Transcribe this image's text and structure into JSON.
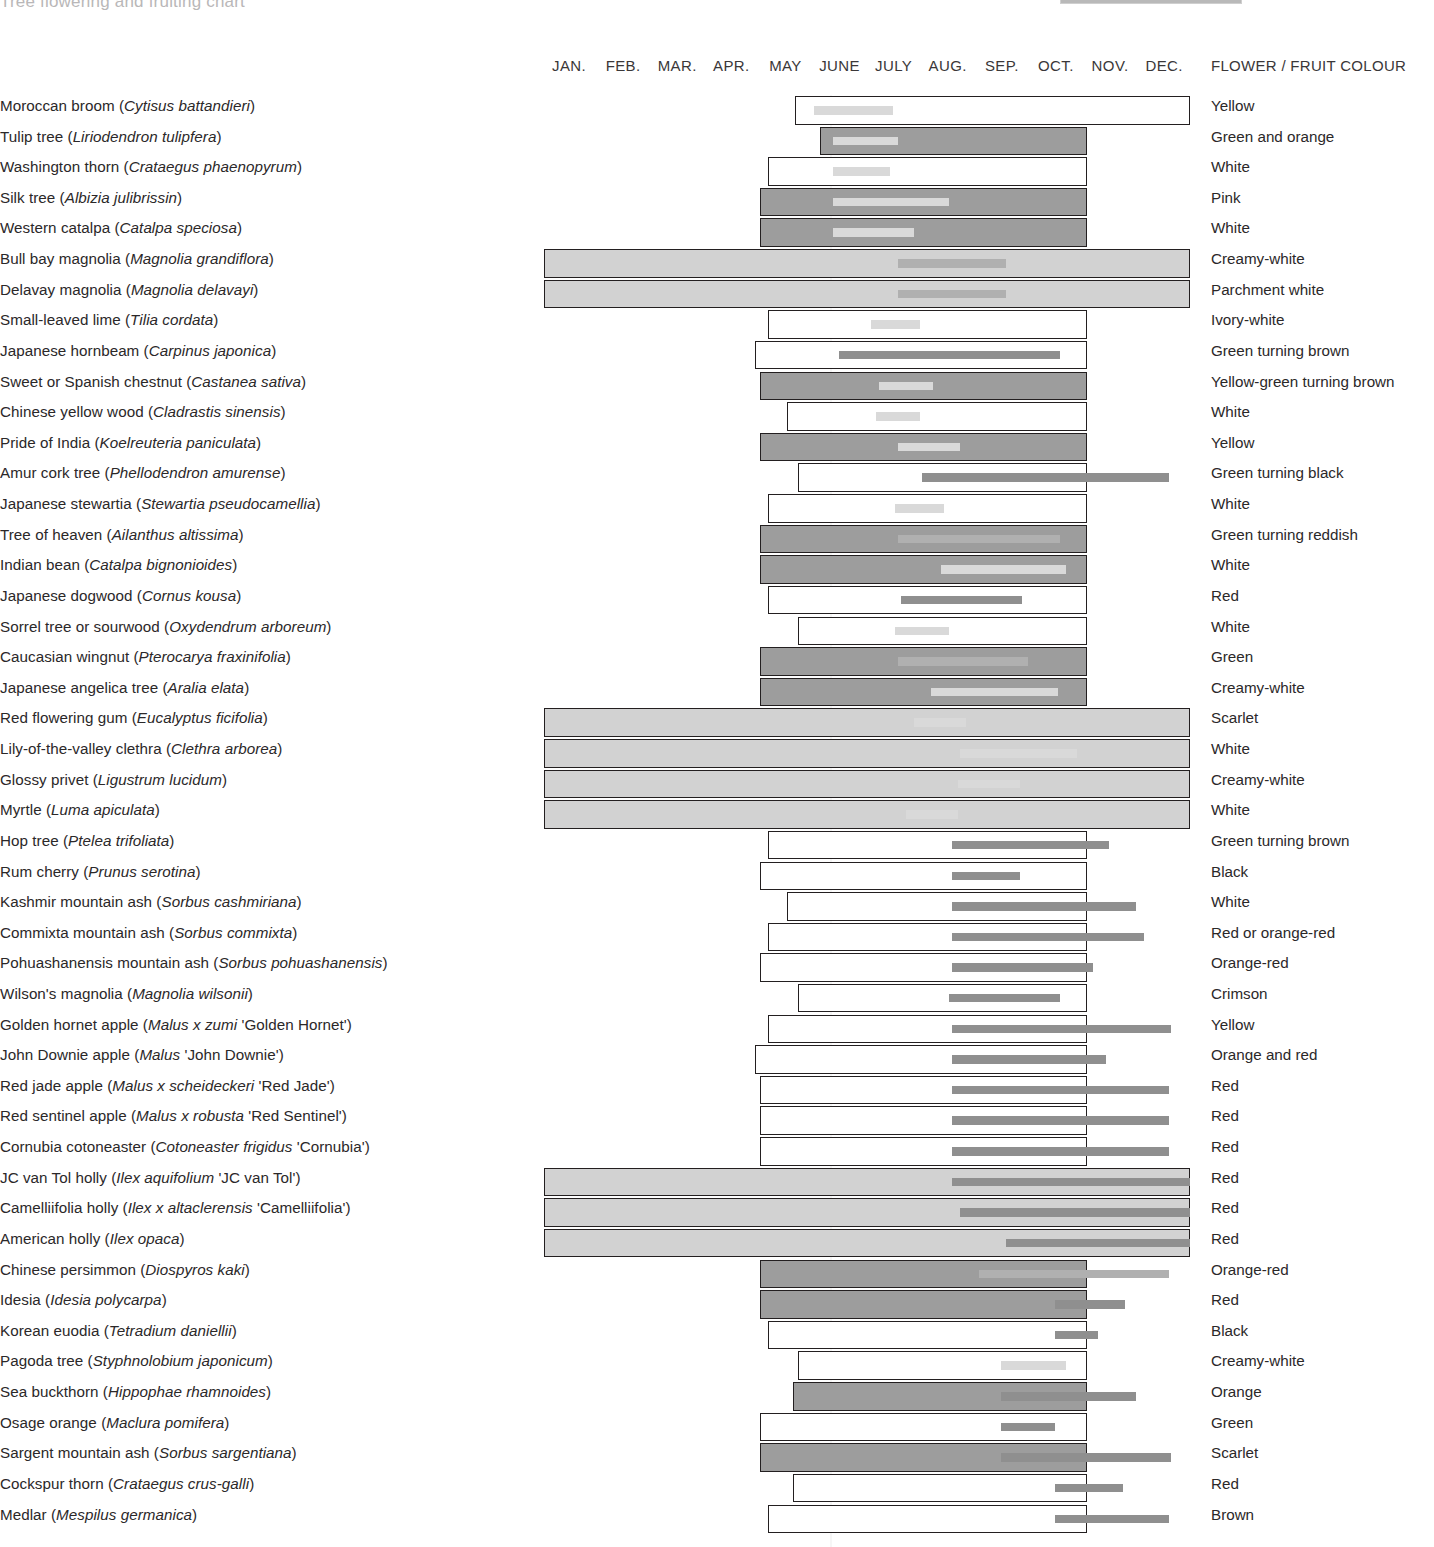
{
  "header": {
    "cropped_title": "Tree flowering and fruiting chart",
    "legend_label": "FLOWERING TIME",
    "legend_swatch_name": "flowering-time-swatch",
    "months": [
      "JAN.",
      "FEB.",
      "MAR.",
      "APR.",
      "MAY",
      "JUNE",
      "JULY",
      "AUG.",
      "SEP.",
      "OCT.",
      "NOV.",
      "DEC."
    ],
    "colour_column_header": "FLOWER / FRUIT COLOUR"
  },
  "palette": {
    "ink": "#231f20",
    "fill_white": "#ffffff",
    "fill_light": "#d2d2d2",
    "fill_mid": "#b3b3b3",
    "fill_dark": "#9d9d9d",
    "bar_pale": "#d9d9d9",
    "bar_mid": "#b0b0b0",
    "bar_dark": "#8f8f8f"
  },
  "chart_data": {
    "type": "bar",
    "xlabel": "Month",
    "ylabel": "Tree species",
    "xlim": [
      0,
      12
    ],
    "x_tick_labels": [
      "JAN.",
      "FEB.",
      "MAR.",
      "APR.",
      "MAY",
      "JUNE",
      "JULY",
      "AUG.",
      "SEP.",
      "OCT.",
      "NOV.",
      "DEC."
    ],
    "grid": false,
    "legend": [
      "FLOWERING TIME"
    ],
    "rows": [
      {
        "common": "Moroccan broom",
        "latin": "Cytisus battandieri",
        "outer": [
          4.7,
          12.0
        ],
        "outer_fill": "white",
        "inner": [
          5.05,
          6.5
        ],
        "inner_tone": "pale",
        "colour": "Yellow"
      },
      {
        "common": "Tulip tree",
        "latin": "Liriodendron tulipfera",
        "outer": [
          5.15,
          10.1
        ],
        "outer_fill": "dark",
        "inner": [
          5.4,
          6.6
        ],
        "inner_tone": "pale",
        "colour": "Green and orange"
      },
      {
        "common": "Washington thorn",
        "latin": "Crataegus phaenopyrum",
        "outer": [
          4.2,
          10.1
        ],
        "outer_fill": "white",
        "inner": [
          5.4,
          6.45
        ],
        "inner_tone": "pale",
        "colour": "White"
      },
      {
        "common": "Silk tree",
        "latin": "Albizia julibrissin",
        "outer": [
          4.05,
          10.1
        ],
        "outer_fill": "dark",
        "inner": [
          5.4,
          7.55
        ],
        "inner_tone": "pale",
        "colour": "Pink"
      },
      {
        "common": "Western catalpa",
        "latin": "Catalpa speciosa",
        "outer": [
          4.05,
          10.1
        ],
        "outer_fill": "dark",
        "inner": [
          5.4,
          6.9
        ],
        "inner_tone": "pale",
        "colour": "White"
      },
      {
        "common": "Bull bay magnolia",
        "latin": "Magnolia grandiflora",
        "outer": [
          0.05,
          12.0
        ],
        "outer_fill": "light",
        "inner": [
          6.6,
          8.6
        ],
        "inner_tone": "mid",
        "colour": "Creamy-white"
      },
      {
        "common": "Delavay magnolia",
        "latin": "Magnolia delavayi",
        "outer": [
          0.05,
          12.0
        ],
        "outer_fill": "light",
        "inner": [
          6.6,
          8.6
        ],
        "inner_tone": "mid",
        "colour": "Parchment white"
      },
      {
        "common": "Small-leaved lime",
        "latin": "Tilia cordata",
        "outer": [
          4.2,
          10.1
        ],
        "outer_fill": "white",
        "inner": [
          6.1,
          7.0
        ],
        "inner_tone": "pale",
        "colour": "Ivory-white"
      },
      {
        "common": "Japanese hornbeam",
        "latin": "Carpinus japonica",
        "outer": [
          3.95,
          10.1
        ],
        "outer_fill": "white",
        "inner": [
          5.5,
          9.6
        ],
        "inner_tone": "dark",
        "colour": "Green turning brown"
      },
      {
        "common": "Sweet or Spanish chestnut",
        "latin": "Castanea sativa",
        "outer": [
          4.05,
          10.1
        ],
        "outer_fill": "dark",
        "inner": [
          6.25,
          7.25
        ],
        "inner_tone": "pale",
        "colour": "Yellow-green turning brown"
      },
      {
        "common": "Chinese yellow wood",
        "latin": "Cladrastis sinensis",
        "outer": [
          4.55,
          10.1
        ],
        "outer_fill": "white",
        "inner": [
          6.2,
          7.0
        ],
        "inner_tone": "pale",
        "colour": "White"
      },
      {
        "common": "Pride of India",
        "latin": "Koelreuteria paniculata",
        "outer": [
          4.05,
          10.1
        ],
        "outer_fill": "dark",
        "inner": [
          6.6,
          7.75
        ],
        "inner_tone": "pale",
        "colour": "Yellow"
      },
      {
        "common": "Amur cork tree",
        "latin": "Phellodendron amurense",
        "outer": [
          4.75,
          10.1
        ],
        "outer_fill": "white",
        "inner": [
          7.05,
          11.6
        ],
        "inner_tone": "dark",
        "colour": "Green turning black"
      },
      {
        "common": "Japanese stewartia",
        "latin": "Stewartia pseudocamellia",
        "outer": [
          4.2,
          10.1
        ],
        "outer_fill": "white",
        "inner": [
          6.55,
          7.45
        ],
        "inner_tone": "pale",
        "colour": "White"
      },
      {
        "common": "Tree of heaven",
        "latin": "Ailanthus altissima",
        "outer": [
          4.05,
          10.1
        ],
        "outer_fill": "dark",
        "inner": [
          6.6,
          9.6
        ],
        "inner_tone": "mid",
        "colour": "Green turning reddish"
      },
      {
        "common": "Indian bean",
        "latin": "Catalpa bignonioides",
        "outer": [
          4.05,
          10.1
        ],
        "outer_fill": "dark",
        "inner": [
          7.4,
          9.7
        ],
        "inner_tone": "pale",
        "colour": "White"
      },
      {
        "common": "Japanese dogwood",
        "latin": "Cornus kousa",
        "outer": [
          4.2,
          10.1
        ],
        "outer_fill": "white",
        "inner": [
          6.65,
          8.9
        ],
        "inner_tone": "dark",
        "colour": "Red"
      },
      {
        "common": "Sorrel tree or sourwood",
        "latin": "Oxydendrum arboreum",
        "outer": [
          4.75,
          10.1
        ],
        "outer_fill": "white",
        "inner": [
          6.55,
          7.55
        ],
        "inner_tone": "pale",
        "colour": "White"
      },
      {
        "common": "Caucasian wingnut",
        "latin": "Pterocarya fraxinifolia",
        "outer": [
          4.05,
          10.1
        ],
        "outer_fill": "dark",
        "inner": [
          6.6,
          9.0
        ],
        "inner_tone": "mid",
        "colour": "Green"
      },
      {
        "common": "Japanese angelica tree",
        "latin": "Aralia elata",
        "outer": [
          4.05,
          10.1
        ],
        "outer_fill": "dark",
        "inner": [
          7.2,
          9.55
        ],
        "inner_tone": "pale",
        "colour": "Creamy-white"
      },
      {
        "common": "Red flowering gum",
        "latin": "Eucalyptus ficifolia",
        "outer": [
          0.05,
          12.0
        ],
        "outer_fill": "light",
        "inner": [
          6.9,
          7.85
        ],
        "inner_tone": "pale",
        "colour": "Scarlet"
      },
      {
        "common": "Lily-of-the-valley clethra",
        "latin": "Clethra arborea",
        "outer": [
          0.05,
          12.0
        ],
        "outer_fill": "light",
        "inner": [
          7.75,
          9.9
        ],
        "inner_tone": "pale",
        "colour": "White"
      },
      {
        "common": "Glossy privet",
        "latin": "Ligustrum lucidum",
        "outer": [
          0.05,
          12.0
        ],
        "outer_fill": "light",
        "inner": [
          7.7,
          8.85
        ],
        "inner_tone": "pale",
        "colour": "Creamy-white"
      },
      {
        "common": "Myrtle",
        "latin": "Luma apiculata",
        "outer": [
          0.05,
          12.0
        ],
        "outer_fill": "light",
        "inner": [
          6.75,
          7.7
        ],
        "inner_tone": "pale",
        "colour": "White"
      },
      {
        "common": "Hop tree",
        "latin": "Ptelea trifoliata",
        "outer": [
          4.2,
          10.1
        ],
        "outer_fill": "white",
        "inner": [
          7.6,
          10.5
        ],
        "inner_tone": "dark",
        "colour": "Green turning brown"
      },
      {
        "common": "Rum cherry",
        "latin": "Prunus serotina",
        "outer": [
          4.05,
          10.1
        ],
        "outer_fill": "white",
        "inner": [
          7.6,
          8.85
        ],
        "inner_tone": "dark",
        "colour": "Black"
      },
      {
        "common": "Kashmir mountain ash",
        "latin": "Sorbus cashmiriana",
        "outer": [
          4.55,
          10.1
        ],
        "outer_fill": "white",
        "inner": [
          7.6,
          11.0
        ],
        "inner_tone": "dark",
        "colour": "White"
      },
      {
        "common": "Commixta mountain ash",
        "latin": "Sorbus commixta",
        "outer": [
          4.2,
          10.1
        ],
        "outer_fill": "white",
        "inner": [
          7.6,
          11.15
        ],
        "inner_tone": "dark",
        "colour": "Red or orange-red"
      },
      {
        "common": "Pohuashanensis mountain ash",
        "latin": "Sorbus pohuashanensis",
        "outer": [
          4.05,
          10.1
        ],
        "outer_fill": "white",
        "inner": [
          7.6,
          10.2
        ],
        "inner_tone": "dark",
        "colour": "Orange-red"
      },
      {
        "common": "Wilson's magnolia",
        "latin": "Magnolia wilsonii",
        "outer": [
          4.75,
          10.1
        ],
        "outer_fill": "white",
        "inner": [
          7.55,
          9.6
        ],
        "inner_tone": "dark",
        "colour": "Crimson"
      },
      {
        "common": "Golden hornet apple",
        "latin": "Malus x zumi 'Golden Hornet'",
        "outer": [
          4.2,
          10.1
        ],
        "outer_fill": "white",
        "inner": [
          7.6,
          11.65
        ],
        "inner_tone": "dark",
        "colour": "Yellow"
      },
      {
        "common": "John Downie apple",
        "latin": "Malus 'John Downie'",
        "outer": [
          3.95,
          10.1
        ],
        "outer_fill": "white",
        "inner": [
          7.6,
          10.45
        ],
        "inner_tone": "dark",
        "colour": "Orange and red"
      },
      {
        "common": "Red jade apple",
        "latin": "Malus x scheideckeri 'Red Jade'",
        "outer": [
          4.05,
          10.1
        ],
        "outer_fill": "white",
        "inner": [
          7.6,
          11.6
        ],
        "inner_tone": "dark",
        "colour": "Red"
      },
      {
        "common": "Red sentinel apple",
        "latin": "Malus x robusta 'Red Sentinel'",
        "outer": [
          4.05,
          10.1
        ],
        "outer_fill": "white",
        "inner": [
          7.6,
          11.6
        ],
        "inner_tone": "dark",
        "colour": "Red"
      },
      {
        "common": "Cornubia cotoneaster",
        "latin": "Cotoneaster frigidus 'Cornubia'",
        "outer": [
          4.05,
          10.1
        ],
        "outer_fill": "white",
        "inner": [
          7.6,
          11.6
        ],
        "inner_tone": "dark",
        "colour": "Red"
      },
      {
        "common": "JC van Tol holly",
        "latin": "Ilex aquifolium 'JC van Tol'",
        "outer": [
          0.05,
          12.0
        ],
        "outer_fill": "light",
        "inner": [
          7.6,
          12.0
        ],
        "inner_tone": "dark",
        "colour": "Red"
      },
      {
        "common": "Camelliifolia holly",
        "latin": "Ilex x altaclerensis 'Camelliifolia'",
        "outer": [
          0.05,
          12.0
        ],
        "outer_fill": "light",
        "inner": [
          7.75,
          12.0
        ],
        "inner_tone": "dark",
        "colour": "Red"
      },
      {
        "common": "American holly",
        "latin": "Ilex opaca",
        "outer": [
          0.05,
          12.0
        ],
        "outer_fill": "light",
        "inner": [
          8.6,
          12.0
        ],
        "inner_tone": "dark",
        "colour": "Red"
      },
      {
        "common": "Chinese persimmon",
        "latin": "Diospyros kaki",
        "outer": [
          4.05,
          10.1
        ],
        "outer_fill": "dark",
        "inner": [
          8.1,
          11.6
        ],
        "inner_tone": "mid",
        "colour": "Orange-red"
      },
      {
        "common": "Idesia",
        "latin": "Idesia polycarpa",
        "outer": [
          4.05,
          10.1
        ],
        "outer_fill": "dark",
        "inner": [
          9.5,
          10.8
        ],
        "inner_tone": "dark",
        "colour": "Red"
      },
      {
        "common": "Korean euodia",
        "latin": "Tetradium daniellii",
        "outer": [
          4.2,
          10.1
        ],
        "outer_fill": "white",
        "inner": [
          9.5,
          10.3
        ],
        "inner_tone": "dark",
        "colour": "Black"
      },
      {
        "common": "Pagoda tree",
        "latin": "Styphnolobium japonicum",
        "outer": [
          4.75,
          10.1
        ],
        "outer_fill": "white",
        "inner": [
          8.5,
          9.7
        ],
        "inner_tone": "pale",
        "colour": "Creamy-white"
      },
      {
        "common": "Sea buckthorn",
        "latin": "Hippophae rhamnoides",
        "outer": [
          4.65,
          10.1
        ],
        "outer_fill": "dark",
        "inner": [
          8.5,
          11.0
        ],
        "inner_tone": "dark",
        "colour": "Orange"
      },
      {
        "common": "Osage orange",
        "latin": "Maclura pomifera",
        "outer": [
          4.05,
          10.1
        ],
        "outer_fill": "white",
        "inner": [
          8.5,
          9.5
        ],
        "inner_tone": "dark",
        "colour": "Green"
      },
      {
        "common": "Sargent mountain ash",
        "latin": "Sorbus sargentiana",
        "outer": [
          4.05,
          10.1
        ],
        "outer_fill": "dark",
        "inner": [
          8.5,
          11.65
        ],
        "inner_tone": "dark",
        "colour": "Scarlet"
      },
      {
        "common": "Cockspur thorn",
        "latin": "Crataegus crus-galli",
        "outer": [
          4.65,
          10.1
        ],
        "outer_fill": "white",
        "inner": [
          9.5,
          10.75
        ],
        "inner_tone": "dark",
        "colour": "Red"
      },
      {
        "common": "Medlar",
        "latin": "Mespilus germanica",
        "outer": [
          4.2,
          10.1
        ],
        "outer_fill": "white",
        "inner": [
          9.5,
          11.6
        ],
        "inner_tone": "dark",
        "colour": "Brown"
      }
    ]
  }
}
